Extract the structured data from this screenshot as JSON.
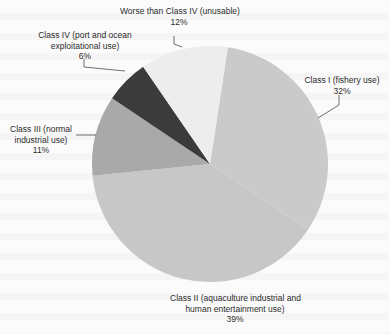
{
  "chart_data": {
    "type": "pie",
    "title": "",
    "start_angle_deg_clockwise_from_top": 8.7,
    "slices": [
      {
        "label": "Class I (fishery use)",
        "value": 32,
        "color": "#cacaca"
      },
      {
        "label": "Class II (aquaculture industrial and human entertainment use)",
        "value": 39,
        "color": "#c7c7c7"
      },
      {
        "label": "Class III (normal industrial use)",
        "value": 11,
        "color": "#a9a9a9"
      },
      {
        "label": "Class IV (port and ocean exploitational use)",
        "value": 6,
        "color": "#3b3b3b"
      },
      {
        "label": "Worse than Class IV (unusable)",
        "value": 12,
        "color": "#ededed"
      }
    ],
    "legend": "none (callout labels)",
    "units": "%"
  },
  "labels": {
    "class1": {
      "line1": "Class I (fishery use)",
      "pct": "32%"
    },
    "class2": {
      "line1": "Class II (aquaculture industrial and",
      "line2": "human entertainment use)",
      "pct": "39%"
    },
    "class3": {
      "line1": "Class III (normal",
      "line2": "industrial use)",
      "pct": "11%"
    },
    "class4": {
      "line1": "Class IV (port and ocean",
      "line2": "exploitational use)",
      "pct": "6%"
    },
    "worse": {
      "line1": "Worse than Class IV (unusable)",
      "pct": "12%"
    }
  }
}
